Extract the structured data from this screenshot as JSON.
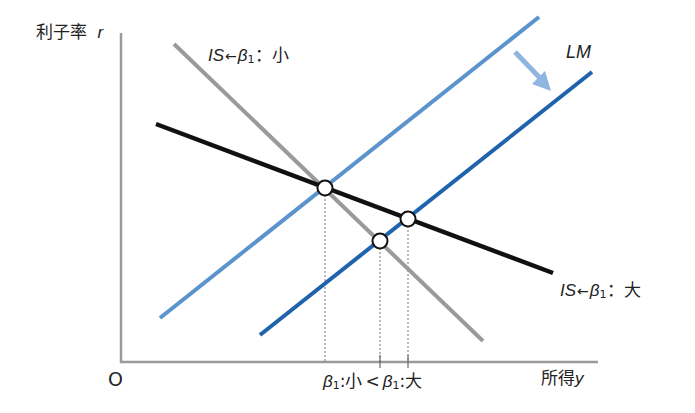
{
  "diagram": {
    "axes": {
      "y_label_text": "利子率",
      "y_label_var": "r",
      "x_label_text": "所得",
      "x_label_var": "y",
      "origin": "O"
    },
    "curves": {
      "is_small": {
        "prefix": "IS",
        "arrow": "←",
        "beta": "β",
        "beta_sub": "1",
        "colon": "：",
        "value": "小",
        "color": "#9a9a9a"
      },
      "is_large": {
        "prefix": "IS",
        "arrow": "←",
        "beta": "β",
        "beta_sub": "1",
        "colon": "：",
        "value": "大",
        "color": "#111111"
      },
      "lm": {
        "label": "LM",
        "color_original": "#5b93cc",
        "color_shifted": "#1f63ad",
        "shift_arrow_color": "#8fb6df"
      }
    },
    "x_axis_annotation": {
      "left_beta": "β",
      "left_sub": "1",
      "left_value": ":小",
      "comparator": "<",
      "right_beta": "β",
      "right_sub": "1",
      "right_value": ":大"
    },
    "equilibria": [
      {
        "name": "initial",
        "x": 325,
        "y": 188
      },
      {
        "name": "beta-small-after-shift",
        "x": 380,
        "y": 241
      },
      {
        "name": "beta-large-after-shift",
        "x": 408,
        "y": 219
      }
    ]
  }
}
